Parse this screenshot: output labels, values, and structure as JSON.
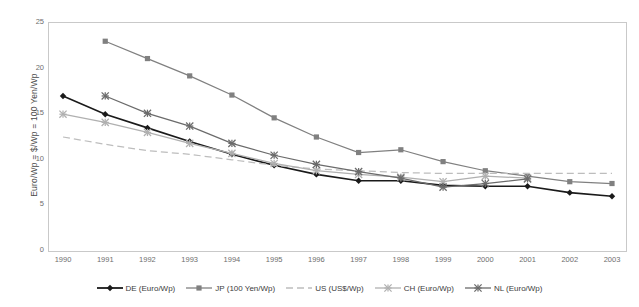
{
  "chart_data": {
    "type": "line",
    "title": "",
    "xlabel": "",
    "ylabel": "Euro/Wp = $/Wp = 100 Yen/Wp",
    "categories": [
      "1990",
      "1991",
      "1992",
      "1993",
      "1994",
      "1995",
      "1996",
      "1997",
      "1998",
      "1999",
      "2000",
      "2001",
      "2002",
      "2003"
    ],
    "x": [
      1990,
      1991,
      1992,
      1993,
      1994,
      1995,
      1996,
      1997,
      1998,
      1999,
      2000,
      2001,
      2002,
      2003
    ],
    "ylim": [
      0,
      25
    ],
    "yticks": [
      0,
      5,
      10,
      15,
      20,
      25
    ],
    "grid": false,
    "legend_position": "bottom",
    "series": [
      {
        "name": "DE (Euro/Wp)",
        "color": "#1a1a1a",
        "marker": "diamond",
        "dashed": false,
        "values": [
          17.0,
          15.0,
          13.5,
          12.0,
          10.6,
          9.4,
          8.4,
          7.7,
          7.7,
          7.2,
          7.1,
          7.1,
          6.4,
          6.0
        ]
      },
      {
        "name": "JP (100 Yen/Wp)",
        "color": "#808080",
        "marker": "square",
        "dashed": false,
        "values": [
          null,
          23.0,
          21.1,
          19.2,
          17.1,
          14.6,
          12.5,
          10.8,
          11.1,
          9.8,
          8.8,
          8.2,
          7.6,
          7.4
        ]
      },
      {
        "name": "US (US$/Wp)",
        "color": "#bdbdbd",
        "marker": "none",
        "dashed": true,
        "values": [
          12.5,
          11.7,
          11.0,
          10.6,
          10.0,
          9.4,
          9.0,
          8.8,
          8.6,
          8.5,
          8.5,
          8.5,
          8.5,
          8.5
        ]
      },
      {
        "name": "CH (Euro/Wp)",
        "color": "#b0b0b0",
        "marker": "star",
        "dashed": false,
        "values": [
          15.0,
          14.1,
          13.0,
          11.8,
          10.7,
          9.6,
          8.8,
          8.4,
          8.1,
          7.6,
          8.2,
          8.0,
          null,
          null
        ]
      },
      {
        "name": "NL (Euro/Wp)",
        "color": "#6b6b6b",
        "marker": "star",
        "dashed": false,
        "values": [
          null,
          17.0,
          15.1,
          13.7,
          11.8,
          10.5,
          9.5,
          8.7,
          8.0,
          7.0,
          7.4,
          7.9,
          null,
          null
        ]
      }
    ]
  },
  "legend": {
    "items": [
      {
        "label": "DE (Euro/Wp)"
      },
      {
        "label": "JP (100 Yen/Wp)"
      },
      {
        "label": "US (US$/Wp)"
      },
      {
        "label": "CH (Euro/Wp)"
      },
      {
        "label": "NL (Euro/Wp)"
      }
    ]
  }
}
